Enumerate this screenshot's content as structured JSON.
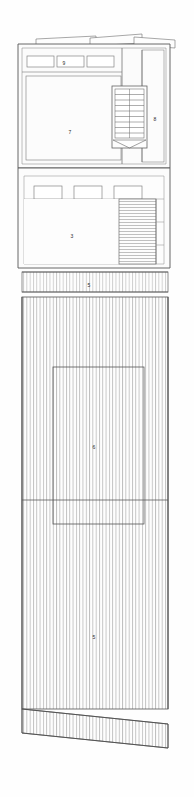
{
  "drawing": {
    "title": "Architectural floor plan",
    "type": "floor-plan",
    "width": 194,
    "height": 797,
    "background_color": "#fefefe",
    "line_color": "#4a4a4a",
    "hatch_color": "#777777",
    "thin_line_color": "#8d8d8d",
    "label_color": "#2b2b2b"
  },
  "sections": {
    "upper": {
      "name": "upper-building-block",
      "bounds": {
        "x": 20,
        "y": 44,
        "width": 148,
        "height": 120
      }
    },
    "middle": {
      "name": "middle-building-block",
      "bounds": {
        "x": 20,
        "y": 166,
        "width": 148,
        "height": 100
      }
    },
    "strip": {
      "name": "hatched-strip-band",
      "bounds": {
        "x": 22,
        "y": 270,
        "width": 146,
        "height": 24
      }
    },
    "lower": {
      "name": "lower-hatched-yard",
      "bounds": {
        "x": 22,
        "y": 296,
        "width": 146,
        "height": 412
      }
    },
    "skirt": {
      "name": "slanted-bottom-band",
      "bounds": {
        "x": 22,
        "y": 708,
        "width": 146,
        "height": 40
      }
    }
  },
  "labels": [
    {
      "id": "label-9",
      "text": "9",
      "x": 64,
      "y": 63,
      "room": "window-center"
    },
    {
      "id": "label-7",
      "text": "7",
      "x": 70,
      "y": 132,
      "room": "main-upper-room"
    },
    {
      "id": "label-8",
      "text": "8",
      "x": 155,
      "y": 119,
      "room": "upper-right-corridor"
    },
    {
      "id": "label-3",
      "text": "3",
      "x": 72,
      "y": 236,
      "room": "middle-room"
    },
    {
      "id": "label-5a",
      "text": "5",
      "x": 89,
      "y": 285,
      "room": "hatched-strip"
    },
    {
      "id": "label-6",
      "text": "6",
      "x": 94,
      "y": 447,
      "room": "lower-yard-upper"
    },
    {
      "id": "label-5b",
      "text": "5",
      "x": 94,
      "y": 637,
      "room": "lower-yard-lower"
    }
  ],
  "upper_windows": [
    {
      "id": "window-left",
      "x": 27,
      "y": 56,
      "width": 27,
      "height": 11
    },
    {
      "id": "window-center",
      "x": 57,
      "y": 56,
      "width": 27,
      "height": 11
    },
    {
      "id": "window-right",
      "x": 87,
      "y": 56,
      "width": 27,
      "height": 11
    }
  ],
  "middle_windows": [
    {
      "id": "mid-window-left",
      "x": 34,
      "y": 186,
      "width": 28,
      "height": 13
    },
    {
      "id": "mid-window-center",
      "x": 74,
      "y": 186,
      "width": 28,
      "height": 13
    },
    {
      "id": "mid-window-right",
      "x": 114,
      "y": 186,
      "width": 28,
      "height": 13
    }
  ],
  "staircase_upper": {
    "name": "upper-staircase",
    "x": 114,
    "y": 89,
    "width": 31,
    "height": 56,
    "tread_count": 9,
    "has_center_stringer": true,
    "has_flared-landing": true
  },
  "staircase_middle": {
    "name": "middle-stair-run",
    "x": 119,
    "y": 198,
    "width": 37,
    "height": 66,
    "hatch_direction": "horizontal",
    "tread_count": 22
  },
  "lower_yard": {
    "name": "lower-yard-hatching",
    "hatch_direction": "vertical",
    "stripe_count": 44,
    "inner_rectangle": {
      "x": 53,
      "y": 367,
      "width": 91,
      "height": 157
    },
    "divider_line_y": 500
  },
  "roof_flaps": [
    {
      "id": "flap-left",
      "x1": 35,
      "y1": 40,
      "x2": 95,
      "y2": 36
    },
    {
      "id": "flap-center",
      "x1": 88,
      "y1": 38,
      "x2": 140,
      "y2": 34
    },
    {
      "id": "flap-right",
      "x1": 133,
      "y1": 37,
      "x2": 172,
      "y2": 40
    }
  ]
}
